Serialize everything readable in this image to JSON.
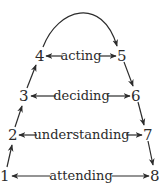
{
  "diagram": {
    "nodes": [
      {
        "id": "1",
        "label": "1"
      },
      {
        "id": "2",
        "label": "2"
      },
      {
        "id": "3",
        "label": "3"
      },
      {
        "id": "4",
        "label": "4"
      },
      {
        "id": "5",
        "label": "5"
      },
      {
        "id": "6",
        "label": "6"
      },
      {
        "id": "7",
        "label": "7"
      },
      {
        "id": "8",
        "label": "8"
      }
    ],
    "levels": [
      {
        "label": "acting",
        "left": "4",
        "right": "5"
      },
      {
        "label": "deciding",
        "left": "3",
        "right": "6"
      },
      {
        "label": "understanding",
        "left": "2",
        "right": "7"
      },
      {
        "label": "attending",
        "left": "1",
        "right": "8"
      }
    ],
    "edges": [
      {
        "from": "1",
        "to": "2"
      },
      {
        "from": "2",
        "to": "3"
      },
      {
        "from": "3",
        "to": "4"
      },
      {
        "from": "4",
        "to": "5",
        "style": "arc"
      },
      {
        "from": "5",
        "to": "6"
      },
      {
        "from": "6",
        "to": "7"
      },
      {
        "from": "7",
        "to": "8"
      }
    ],
    "colors": {
      "stroke": "#2b2b2b",
      "background": "#ffffff"
    }
  }
}
